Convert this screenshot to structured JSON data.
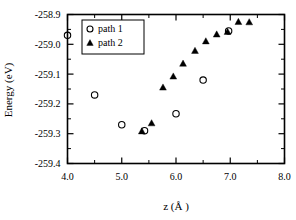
{
  "chart_data": {
    "type": "scatter",
    "title": "",
    "xlabel": "z (Å )",
    "ylabel": "Energy (eV)",
    "xlim": [
      4.0,
      8.0
    ],
    "ylim": [
      -259.4,
      -258.9
    ],
    "xticks": [
      "4.0",
      "5.0",
      "6.0",
      "7.0",
      "8.0"
    ],
    "xtick_values": [
      4.0,
      5.0,
      6.0,
      7.0,
      8.0
    ],
    "yticks": [
      "-258.9",
      "-259.0",
      "-259.1",
      "-259.2",
      "-259.3",
      "-259.4"
    ],
    "ytick_values": [
      -258.9,
      -259.0,
      -259.1,
      -259.2,
      -259.3,
      -259.4
    ],
    "grid": false,
    "legend_position": "upper-left",
    "minor_ticks": true,
    "series": [
      {
        "name": "path 1",
        "marker": "open-circle",
        "color": "#000000",
        "x": [
          4.0,
          4.5,
          5.0,
          5.42,
          6.0,
          6.5,
          6.97
        ],
        "y": [
          -258.97,
          -259.17,
          -259.27,
          -259.29,
          -259.233,
          -259.12,
          -258.955
        ]
      },
      {
        "name": "path 2",
        "marker": "filled-triangle",
        "color": "#000000",
        "x": [
          5.37,
          5.55,
          5.76,
          5.95,
          6.13,
          6.35,
          6.55,
          6.75,
          6.95,
          7.15,
          7.35
        ],
        "y": [
          -259.292,
          -259.265,
          -259.145,
          -259.108,
          -259.065,
          -259.022,
          -258.99,
          -258.967,
          -258.958,
          -258.925,
          -258.926
        ]
      }
    ]
  },
  "legend": {
    "entries": [
      {
        "label": "path 1",
        "marker": "open-circle"
      },
      {
        "label": "path 2",
        "marker": "filled-triangle"
      }
    ]
  }
}
